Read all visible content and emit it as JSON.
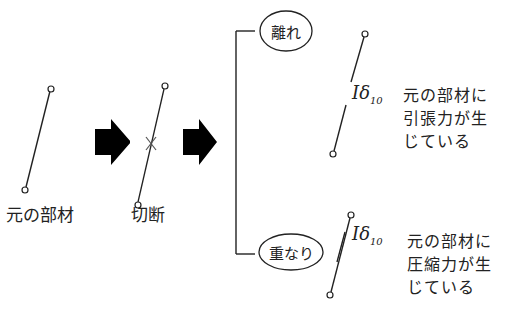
{
  "diagram": {
    "original_label": "元の部材",
    "cut_label": "切断",
    "branches": [
      {
        "case_label": "離れ",
        "displacement_symbol": "δ",
        "displacement_subscript": "10",
        "note_lines": [
          "元の部材に",
          "引張力が生",
          "じている"
        ]
      },
      {
        "case_label": "重なり",
        "displacement_symbol": "δ",
        "displacement_subscript": "10",
        "note_lines": [
          "元の部材に",
          "圧縮力が生",
          "じている"
        ]
      }
    ],
    "colors": {
      "line": "#222222",
      "arrow": "#000000",
      "background": "#ffffff"
    }
  }
}
